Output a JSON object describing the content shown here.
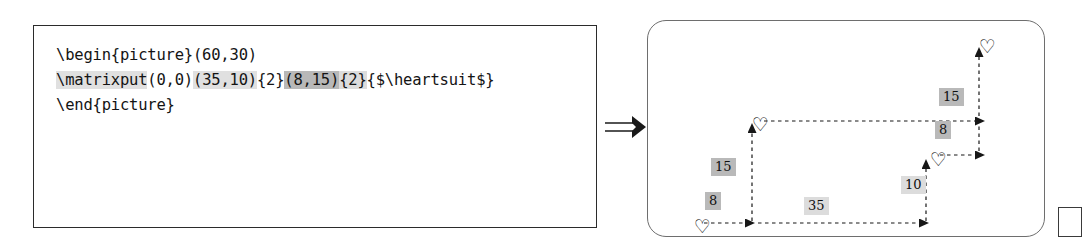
{
  "code_panel": {
    "lines": [
      {
        "segments": [
          {
            "text": "\\begin{picture}(60,30)",
            "highlight": "none"
          }
        ]
      },
      {
        "segments": [
          {
            "text": "\\matrixput",
            "highlight": "light"
          },
          {
            "text": "(0,0)",
            "highlight": "none"
          },
          {
            "text": "(35,10)",
            "highlight": "light"
          },
          {
            "text": "{2}",
            "highlight": "none"
          },
          {
            "text": "(8,15)",
            "highlight": "dark"
          },
          {
            "text": "{2}",
            "highlight": "mid"
          },
          {
            "text": "{$\\heartsuit$}",
            "highlight": "none"
          }
        ]
      },
      {
        "segments": [
          {
            "text": "\\end{picture}",
            "highlight": "none"
          }
        ]
      }
    ]
  },
  "implies": {
    "symbol": "⟹",
    "label": "implies-arrow"
  },
  "diagram": {
    "hearts": [
      {
        "id": "heart-origin",
        "x": 46,
        "y": 196,
        "label": "♡"
      },
      {
        "id": "heart-col-step",
        "x": 104,
        "y": 94,
        "label": "♡"
      },
      {
        "id": "heart-row-step",
        "x": 282,
        "y": 129,
        "label": "♡"
      },
      {
        "id": "heart-both-steps",
        "x": 331,
        "y": 16,
        "label": "♡"
      }
    ],
    "offset_labels": [
      {
        "id": "offset-x-bottom-left",
        "value": "8",
        "x": 57,
        "y": 171,
        "tone": "dark"
      },
      {
        "id": "offset-y-left",
        "value": "15",
        "x": 63,
        "y": 137,
        "tone": "dark"
      },
      {
        "id": "pitch-x-bottom",
        "value": "35",
        "x": 156,
        "y": 176,
        "tone": "pale"
      },
      {
        "id": "pitch-y-right",
        "value": "10",
        "x": 253,
        "y": 155,
        "tone": "pale"
      },
      {
        "id": "offset-x-upper",
        "value": "8",
        "x": 287,
        "y": 100,
        "tone": "dark"
      },
      {
        "id": "offset-y-upper",
        "value": "15",
        "x": 291,
        "y": 67,
        "tone": "dark"
      }
    ],
    "arrows": [
      {
        "id": "arrow-origin-right-8",
        "from": [
          56,
          202
        ],
        "to": [
          98,
          202
        ],
        "dir": "right"
      },
      {
        "id": "arrow-origin-up-15",
        "from": [
          104,
          200
        ],
        "to": [
          104,
          112
        ],
        "dir": "up"
      },
      {
        "id": "arrow-pitch-right-35",
        "from": [
          110,
          202
        ],
        "to": [
          272,
          202
        ],
        "dir": "right"
      },
      {
        "id": "arrow-pitch-up-10",
        "from": [
          278,
          200
        ],
        "to": [
          278,
          148
        ],
        "dir": "up"
      },
      {
        "id": "arrow-upper-right-8",
        "from": [
          292,
          134
        ],
        "to": [
          328,
          134
        ],
        "dir": "right"
      },
      {
        "id": "arrow-upper-top-right",
        "from": [
          116,
          100
        ],
        "to": [
          328,
          100
        ],
        "dir": "right"
      },
      {
        "id": "arrow-upper-up-15",
        "from": [
          331,
          130
        ],
        "to": [
          331,
          36
        ],
        "dir": "up"
      }
    ]
  },
  "colors": {
    "code_border": "#2b2b2b",
    "panel_border": "#6e6e6e",
    "chip_dark": "#b9b9b9",
    "chip_pale": "#dcdcdc",
    "ink": "#101010"
  }
}
